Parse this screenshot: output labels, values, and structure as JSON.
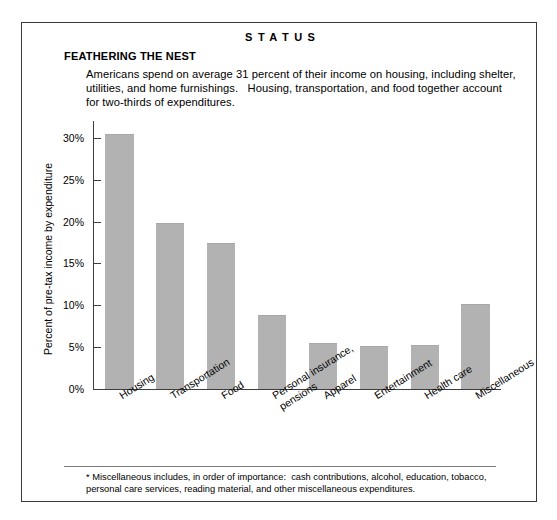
{
  "header": {
    "kicker": "STATUS",
    "headline": "FEATHERING THE NEST",
    "deck": "Americans spend on average 31 percent of their income on housing, including shelter, utilities, and home furnishings.   Housing, transportation, and food together account for two-thirds of expenditures."
  },
  "footnote": {
    "text": "* Miscellaneous includes, in order of importance:  cash contributions, alcohol, education, tobacco, personal care services, reading material, and other miscellaneous expenditures."
  },
  "colors": {
    "bar_fill": "#b2b2b2",
    "axis": "#3d3d3d",
    "border": "#3a3a3a",
    "background": "#ffffff"
  },
  "chart_data": {
    "type": "bar",
    "title": "FEATHERING THE NEST",
    "xlabel": "",
    "ylabel": "Percent of pre-tax income by expenditure",
    "ylim": [
      0,
      32
    ],
    "grid": false,
    "legend": null,
    "ytick_labels": [
      "30%",
      "25%",
      "20%",
      "15%",
      "10%",
      "5%",
      "0%"
    ],
    "ytick_values": [
      30,
      25,
      20,
      15,
      10,
      5,
      0
    ],
    "categories": [
      "Housing",
      "Transportation",
      "Food",
      "Personal insurance,\npensions",
      "Apparel",
      "Entertainment",
      "Health care",
      "Miscellaneous"
    ],
    "values": [
      30.4,
      19.8,
      17.4,
      8.8,
      5.5,
      5.1,
      5.2,
      10.2
    ]
  }
}
